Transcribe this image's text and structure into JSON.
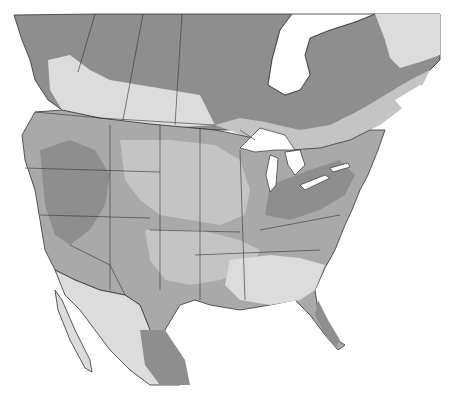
{
  "map": {
    "type": "shaded-region-map",
    "region": "North America (Canada, United States, Mexico)",
    "labels": [],
    "legend": [],
    "colors": {
      "background": "#ffffff",
      "water": "#ffffff",
      "zone_dark": "#8e8e8e",
      "zone_medium": "#a9a9a9",
      "zone_light": "#c4c4c4",
      "zone_pale": "#dcdcdc",
      "border": "#333333"
    }
  }
}
